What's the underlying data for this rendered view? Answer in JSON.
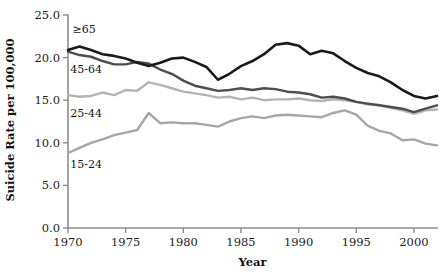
{
  "chart_data": {
    "type": "line",
    "title": "",
    "xlabel": "Year",
    "ylabel": "Suicide Rate per 100,000",
    "xlim": [
      1970,
      2002
    ],
    "ylim": [
      0.0,
      25.0
    ],
    "grid": false,
    "legend_position": "inline-labels",
    "x_ticks": [
      "1970",
      "1975",
      "1980",
      "1985",
      "1990",
      "1995",
      "2000"
    ],
    "x_tick_values": [
      1970,
      1975,
      1980,
      1985,
      1990,
      1995,
      2000
    ],
    "y_ticks": [
      "0.0",
      "5.0",
      "10.0",
      "15.0",
      "20.0",
      "25.0"
    ],
    "y_tick_values": [
      0.0,
      5.0,
      10.0,
      15.0,
      20.0,
      25.0
    ],
    "x": [
      1970,
      1971,
      1972,
      1973,
      1974,
      1975,
      1976,
      1977,
      1978,
      1979,
      1980,
      1981,
      1982,
      1983,
      1984,
      1985,
      1986,
      1987,
      1988,
      1989,
      1990,
      1991,
      1992,
      1993,
      1994,
      1995,
      1996,
      1997,
      1998,
      1999,
      2000,
      2001,
      2002
    ],
    "series": [
      {
        "name": "≥65",
        "label": "≥65",
        "color": "#1a1a1a",
        "stroke_width": 2.6,
        "values": [
          20.9,
          21.3,
          20.9,
          20.4,
          20.2,
          19.9,
          19.4,
          19.0,
          19.4,
          19.9,
          20.0,
          19.5,
          18.9,
          17.4,
          18.1,
          19.0,
          19.6,
          20.4,
          21.5,
          21.7,
          21.4,
          20.4,
          20.8,
          20.5,
          19.6,
          18.8,
          18.2,
          17.8,
          17.1,
          16.2,
          15.5,
          15.2,
          15.5
        ]
      },
      {
        "name": "45-64",
        "label": "45-64",
        "color": "#4d4d4d",
        "stroke_width": 2.4,
        "values": [
          20.7,
          20.3,
          20.1,
          19.6,
          19.2,
          19.2,
          19.5,
          19.3,
          18.6,
          18.1,
          17.3,
          16.7,
          16.4,
          16.1,
          16.2,
          16.4,
          16.2,
          16.4,
          16.3,
          16.0,
          15.9,
          15.7,
          15.3,
          15.4,
          15.2,
          14.8,
          14.6,
          14.4,
          14.2,
          14.0,
          13.6,
          14.0,
          14.4
        ]
      },
      {
        "name": "25-44",
        "label": "25-44",
        "color": "#b3b3b3",
        "stroke_width": 2.4,
        "values": [
          15.6,
          15.4,
          15.5,
          15.9,
          15.6,
          16.2,
          16.1,
          17.1,
          16.8,
          16.4,
          16.0,
          15.8,
          15.6,
          15.3,
          15.4,
          15.1,
          15.3,
          15.0,
          15.1,
          15.1,
          15.2,
          15.0,
          14.9,
          15.1,
          15.0,
          14.8,
          14.5,
          14.4,
          14.1,
          13.8,
          13.4,
          13.8,
          13.9
        ]
      },
      {
        "name": "15-24",
        "label": "15-24",
        "color": "#a6a6a6",
        "stroke_width": 2.4,
        "values": [
          8.8,
          9.4,
          10.0,
          10.4,
          10.9,
          11.2,
          11.5,
          13.5,
          12.3,
          12.4,
          12.3,
          12.3,
          12.1,
          11.9,
          12.5,
          12.9,
          13.1,
          12.9,
          13.2,
          13.3,
          13.2,
          13.1,
          13.0,
          13.5,
          13.8,
          13.3,
          12.0,
          11.4,
          11.1,
          10.3,
          10.4,
          9.9,
          9.7
        ]
      }
    ],
    "series_label_positions": [
      {
        "label": "≥65",
        "x": 1970.4,
        "y": 22.9
      },
      {
        "label": "45-64",
        "x": 1970.2,
        "y": 18.2
      },
      {
        "label": "25-44",
        "x": 1970.2,
        "y": 13.0
      },
      {
        "label": "15-24",
        "x": 1970.2,
        "y": 7.0
      }
    ]
  }
}
